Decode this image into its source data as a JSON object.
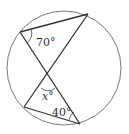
{
  "diagram": {
    "type": "inscribed-angles",
    "labels": {
      "angle_top": "70°",
      "angle_x": "x°",
      "angle_bottom": "40°"
    },
    "colors": {
      "stroke": "#333333",
      "circle": "#555555",
      "background": "#ffffff"
    }
  }
}
